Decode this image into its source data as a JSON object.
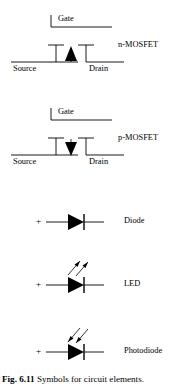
{
  "figure": {
    "caption_label": "Fig. 6.11",
    "caption_text": "Symbols for circuit elements.",
    "ink_color": "#000000",
    "background_color": "#ffffff"
  },
  "symbols": [
    {
      "id": "n-mosfet",
      "name": "n-MOSFET",
      "type_label": "n-MOSFET",
      "gate_label": "Gate",
      "source_label": "Source",
      "drain_label": "Drain",
      "arrow_direction": "up",
      "arrow_meaning": "filled triangle pointing up"
    },
    {
      "id": "p-mosfet",
      "name": "p-MOSFET",
      "type_label": "p-MOSFET",
      "gate_label": "Gate",
      "source_label": "Source",
      "drain_label": "Drain",
      "arrow_direction": "down",
      "arrow_meaning": "filled triangle pointing down"
    },
    {
      "id": "diode",
      "name": "Diode",
      "type_label": "Diode",
      "polarity_label": "+",
      "light_arrows": "none"
    },
    {
      "id": "led",
      "name": "LED",
      "type_label": "LED",
      "polarity_label": "+",
      "light_arrows": "two arrows pointing away (up-right), light emitted"
    },
    {
      "id": "photodiode",
      "name": "Photodiode",
      "type_label": "Photodiode",
      "polarity_label": "+",
      "light_arrows": "two arrows pointing toward device (down-left), light absorbed"
    }
  ]
}
